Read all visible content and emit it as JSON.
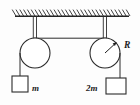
{
  "figure": {
    "type": "physics-diagram",
    "background_color": "#fdfdfd",
    "ink_color": "#2b2b2b",
    "ceiling": {
      "name": "hatched-ceiling",
      "x_start": 15,
      "x_end": 129,
      "y": 16,
      "hatch_count": 30
    },
    "supports": [
      {
        "name": "left-support-rod",
        "x": 35,
        "y_top": 16,
        "y_bottom": 52
      },
      {
        "name": "right-support-rod",
        "x": 105,
        "y_top": 16,
        "y_bottom": 52
      }
    ],
    "pulleys": [
      {
        "name": "left-pulley",
        "cx": 35,
        "cy": 53,
        "r": 15
      },
      {
        "name": "right-pulley",
        "cx": 105,
        "cy": 53,
        "r": 15
      }
    ],
    "connecting_cord": {
      "name": "horizontal-cord",
      "x_start": 35,
      "x_end": 105,
      "y": 38
    },
    "masses": [
      {
        "name": "left-mass-block",
        "label": "m",
        "label_side": "right",
        "x": 12,
        "y": 76,
        "width": 16,
        "height": 16,
        "cord_x": 20,
        "cord_y_top": 53
      },
      {
        "name": "right-mass-block",
        "label": "2m",
        "label_side": "left",
        "x": 106,
        "y": 78,
        "width": 20,
        "height": 16,
        "cord_x": 120,
        "cord_y_top": 53
      }
    ],
    "radius_annotation": {
      "name": "radius-label",
      "label": "R",
      "label_x": 125,
      "label_y": 48,
      "from_x": 105,
      "from_y": 53,
      "to_x": 116,
      "to_y": 43
    }
  }
}
